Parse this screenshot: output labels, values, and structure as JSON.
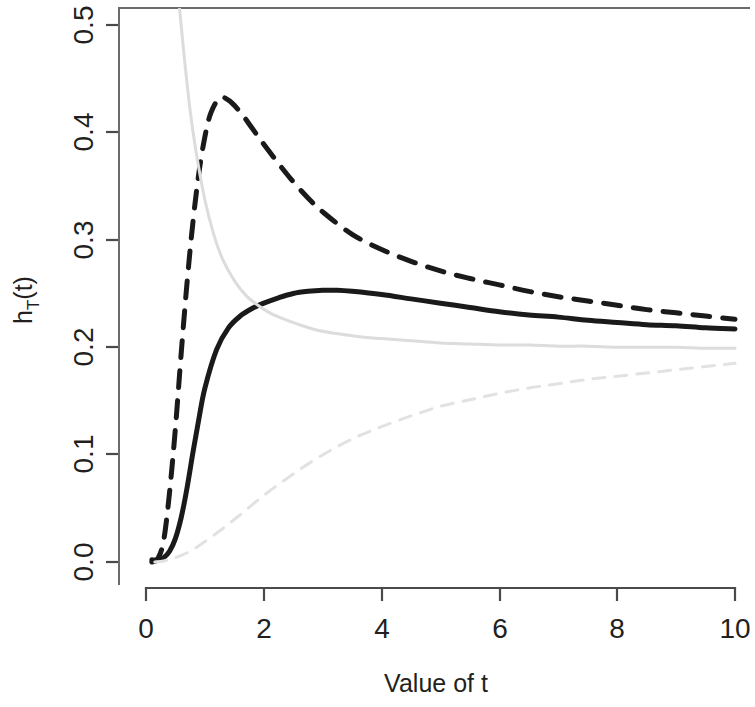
{
  "chart_data": {
    "type": "line",
    "title": "",
    "xlabel": "Value of t",
    "ylabel": "h_T(t)",
    "ylabel_base": "h",
    "ylabel_subscript": "T",
    "ylabel_suffix": "(t)",
    "xlim": [
      0,
      10.2
    ],
    "ylim": [
      0.0,
      0.52
    ],
    "xticks": [
      0,
      2,
      4,
      6,
      8,
      10
    ],
    "xticklabels": [
      "0",
      "2",
      "4",
      "6",
      "8",
      "10"
    ],
    "yticks": [
      0.0,
      0.1,
      0.2,
      0.3,
      0.4,
      0.5
    ],
    "yticklabels": [
      "0.0",
      "0.1",
      "0.2",
      "0.3",
      "0.4",
      "0.5"
    ],
    "grid": false,
    "legend": "none",
    "colors": {
      "black": "#1a1a1a",
      "light_gray": "#d9d9d9",
      "axis": "#4a4a4a",
      "background": "#ffffff"
    },
    "series": [
      {
        "name": "black-dashed",
        "style": "dashed",
        "color": "#1a1a1a",
        "width": 5,
        "dash": "17 13",
        "peak_x": 1.25,
        "peak_y": 0.432,
        "x": [
          0.1,
          0.2,
          0.3,
          0.4,
          0.5,
          0.6,
          0.7,
          0.8,
          0.9,
          1.0,
          1.1,
          1.25,
          1.4,
          1.6,
          1.8,
          2.0,
          2.25,
          2.5,
          2.75,
          3.0,
          3.5,
          4.0,
          4.5,
          5.0,
          5.5,
          6.0,
          6.5,
          7.0,
          7.5,
          8.0,
          8.5,
          9.0,
          9.5,
          10.0
        ],
        "y": [
          0.0,
          0.003,
          0.02,
          0.065,
          0.125,
          0.196,
          0.262,
          0.318,
          0.363,
          0.396,
          0.418,
          0.432,
          0.43,
          0.419,
          0.404,
          0.389,
          0.371,
          0.354,
          0.339,
          0.326,
          0.305,
          0.291,
          0.28,
          0.271,
          0.264,
          0.258,
          0.252,
          0.247,
          0.243,
          0.239,
          0.235,
          0.232,
          0.229,
          0.226
        ]
      },
      {
        "name": "black-solid",
        "style": "solid",
        "color": "#1a1a1a",
        "width": 5,
        "dash": "none",
        "peak_x": 3.0,
        "peak_y": 0.253,
        "x": [
          0.1,
          0.2,
          0.3,
          0.4,
          0.5,
          0.6,
          0.7,
          0.8,
          0.9,
          1.0,
          1.2,
          1.4,
          1.6,
          1.8,
          2.0,
          2.25,
          2.5,
          2.75,
          3.0,
          3.25,
          3.5,
          4.0,
          4.5,
          5.0,
          5.5,
          6.0,
          6.5,
          7.0,
          7.5,
          8.0,
          8.5,
          9.0,
          9.5,
          10.0
        ],
        "y": [
          0.002,
          0.002,
          0.004,
          0.01,
          0.022,
          0.042,
          0.07,
          0.103,
          0.134,
          0.162,
          0.198,
          0.218,
          0.229,
          0.236,
          0.241,
          0.246,
          0.25,
          0.252,
          0.253,
          0.253,
          0.252,
          0.249,
          0.245,
          0.241,
          0.237,
          0.233,
          0.23,
          0.228,
          0.225,
          0.223,
          0.221,
          0.22,
          0.218,
          0.217
        ]
      },
      {
        "name": "gray-solid",
        "style": "solid",
        "color": "#dcdcdc",
        "width": 3,
        "dash": "none",
        "x": [
          0.52,
          0.57,
          0.65,
          0.75,
          0.85,
          1.0,
          1.15,
          1.3,
          1.5,
          1.7,
          1.9,
          2.1,
          2.3,
          2.6,
          2.9,
          3.2,
          3.6,
          4.0,
          4.5,
          5.0,
          5.5,
          6.0,
          6.5,
          7.0,
          7.5,
          8.0,
          8.5,
          9.0,
          9.5,
          10.0
        ],
        "y": [
          0.535,
          0.515,
          0.47,
          0.42,
          0.382,
          0.337,
          0.305,
          0.282,
          0.262,
          0.248,
          0.239,
          0.232,
          0.227,
          0.221,
          0.216,
          0.213,
          0.21,
          0.208,
          0.206,
          0.204,
          0.203,
          0.202,
          0.202,
          0.201,
          0.201,
          0.2,
          0.2,
          0.2,
          0.199,
          0.199
        ]
      },
      {
        "name": "gray-dashed",
        "style": "dashed",
        "color": "#e2e2e2",
        "width": 3,
        "dash": "12 10",
        "x": [
          0.15,
          0.3,
          0.5,
          0.75,
          1.0,
          1.3,
          1.6,
          2.0,
          2.4,
          2.8,
          3.2,
          3.6,
          4.0,
          4.5,
          5.0,
          5.5,
          6.0,
          6.5,
          7.0,
          7.5,
          8.0,
          8.5,
          9.0,
          9.5,
          10.0
        ],
        "y": [
          0.0,
          0.001,
          0.004,
          0.01,
          0.019,
          0.031,
          0.044,
          0.062,
          0.078,
          0.093,
          0.106,
          0.117,
          0.126,
          0.136,
          0.145,
          0.151,
          0.157,
          0.162,
          0.166,
          0.17,
          0.173,
          0.176,
          0.179,
          0.182,
          0.185
        ]
      }
    ]
  },
  "axes": {
    "x_axis_name": "x-axis",
    "y_axis_name": "y-axis"
  }
}
